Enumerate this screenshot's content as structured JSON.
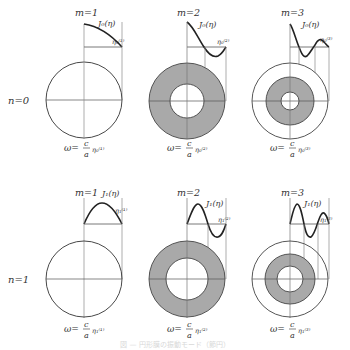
{
  "figure": {
    "caption": "図 — 円形膜の振動モード（節円）",
    "colors": {
      "line": "#2a2a2a",
      "guide": "#8a8a8a",
      "fill": "#a9a9a9",
      "background": "#ffffff"
    },
    "row_labels": [
      {
        "n": "n=0"
      },
      {
        "n": "n=1"
      }
    ],
    "panels": [
      {
        "row": 0,
        "col": 0,
        "m_label": "m=1",
        "func_label": "J₀(η)",
        "root_label": "η₀⁽¹⁾",
        "omega_lhs": "ω=",
        "omega_num": "c",
        "omega_den": "a",
        "omega_rhs": "η₀⁽¹⁾",
        "nodal_circles": 0
      },
      {
        "row": 0,
        "col": 1,
        "m_label": "m=2",
        "func_label": "J₀(η)",
        "root_label": "η₀⁽²⁾",
        "omega_lhs": "ω=",
        "omega_num": "c",
        "omega_den": "a",
        "omega_rhs": "η₀⁽²⁾",
        "nodal_circles": 1
      },
      {
        "row": 0,
        "col": 2,
        "m_label": "m=3",
        "func_label": "J₀(η)",
        "root_label": "η₀⁽³⁾",
        "omega_lhs": "ω=",
        "omega_num": "c",
        "omega_den": "a",
        "omega_rhs": "η₀⁽³⁾",
        "nodal_circles": 2
      },
      {
        "row": 1,
        "col": 0,
        "m_label": "m=1",
        "func_label": "J₁(η)",
        "root_label": "η₁⁽¹⁾",
        "omega_lhs": "ω=",
        "omega_num": "c",
        "omega_den": "a",
        "omega_rhs": "η₁⁽¹⁾",
        "nodal_circles": 0
      },
      {
        "row": 1,
        "col": 1,
        "m_label": "m=2",
        "func_label": "J₁(η)",
        "root_label": "η₁⁽²⁾",
        "omega_lhs": "ω=",
        "omega_num": "c",
        "omega_den": "a",
        "omega_rhs": "η₁⁽²⁾",
        "nodal_circles": 1
      },
      {
        "row": 1,
        "col": 2,
        "m_label": "m=3",
        "func_label": "J₁(η)",
        "root_label": "η₁⁽³⁾",
        "omega_lhs": "ω=",
        "omega_num": "c",
        "omega_den": "a",
        "omega_rhs": "η₁⁽³⁾",
        "nodal_circles": 2
      }
    ]
  }
}
